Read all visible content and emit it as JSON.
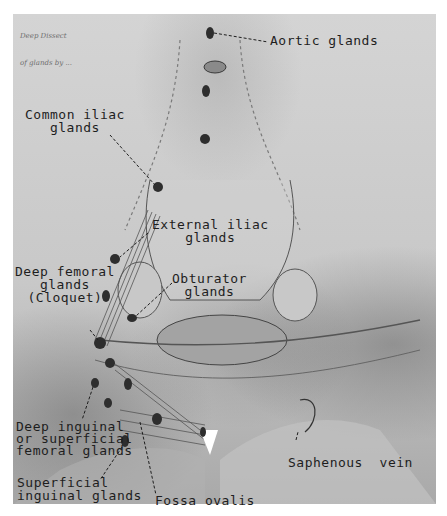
{
  "figure": {
    "handwritten_note": [
      "Deep Dissect",
      "of glands by ..."
    ],
    "labels": {
      "aortic": "Aortic glands",
      "common_iliac": "Common iliac\nglands",
      "external_iliac": "External iliac\nglands",
      "deep_femoral": "Deep femoral\nglands\n(Cloquet)",
      "obturator": "Obturator\nglands",
      "deep_inguinal": "Deep inguinal\nor superficial\nfemoral glands",
      "superficial_inguinal": "Superficial\ninguinal glands",
      "fossa_ovalis": "Fossa ovalis",
      "saphenous_vein": "Saphenous  vein"
    },
    "colors": {
      "background": "#ffffff",
      "plate": "#cfcfcf",
      "ink": "#1e1e1e",
      "gland": "#2e2e2e"
    }
  }
}
